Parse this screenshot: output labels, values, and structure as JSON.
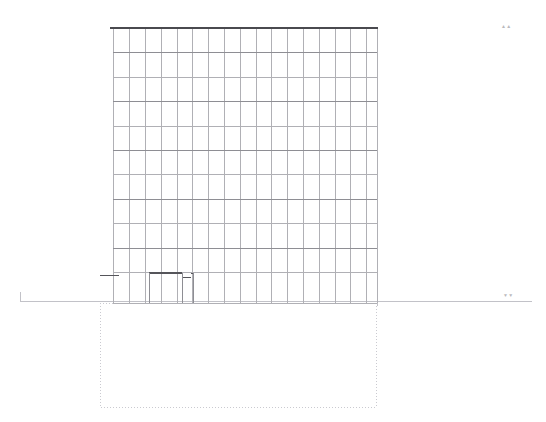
{
  "sheet": {
    "title": "Building Elevation",
    "drawing_type": "elevation",
    "width": 546,
    "height": 422,
    "background_color": "#ffffff"
  },
  "colors": {
    "roof_line": "#4a4a4f",
    "facade_grid": "#b0b0b5",
    "facade_grid_strong": "#8e8e94",
    "ground_line": "#c2c2c8",
    "basement_dashed": "#cacad0",
    "canopy_dark": "#55555a",
    "marker_text": "#b9b9bd"
  },
  "building": {
    "label": "tower-facade",
    "left": 113,
    "right": 377,
    "roof_y": 28,
    "base_y": 303,
    "column_count": 17,
    "floor_count": 11,
    "column_x": [
      113,
      129,
      145,
      161,
      177,
      192,
      208,
      224,
      240,
      256,
      271,
      287,
      303,
      319,
      335,
      350,
      366,
      377
    ],
    "floor_y": [
      28,
      52,
      77,
      101,
      126,
      150,
      174,
      199,
      223,
      248,
      272,
      303
    ],
    "strong_floor_y": [
      52,
      101,
      150,
      199,
      248
    ],
    "roof_thickness": 2
  },
  "entrance": {
    "label": "entrance-canopy",
    "steps": [
      {
        "x1": 149,
        "x2": 182,
        "y": 273,
        "thickness": 2
      },
      {
        "x1": 182,
        "x2": 191,
        "y": 277,
        "thickness": 1
      },
      {
        "x1": 191,
        "x2": 193,
        "y": 273,
        "thickness": 1
      }
    ],
    "drop_lines": [
      {
        "x": 149,
        "y1": 273,
        "y2": 303
      },
      {
        "x": 182,
        "y1": 273,
        "y2": 303
      },
      {
        "x": 193,
        "y1": 273,
        "y2": 303
      }
    ],
    "level_tick": {
      "x1": 100,
      "x2": 119,
      "y": 275
    }
  },
  "ground": {
    "label": "grade-line",
    "y": 301,
    "left_x": 20,
    "right_x": 532,
    "left_tick": {
      "x": 20,
      "y1": 292,
      "y2": 301
    },
    "right_tick": {
      "x": 377,
      "y1": 296,
      "y2": 306
    }
  },
  "basement": {
    "label": "below-grade-outline",
    "left": 100,
    "right": 376,
    "top": 303,
    "bottom": 407,
    "dash_pattern": "1 2"
  },
  "markers": {
    "north_symbol": "▲▲",
    "grade_symbol": "▼▼"
  }
}
